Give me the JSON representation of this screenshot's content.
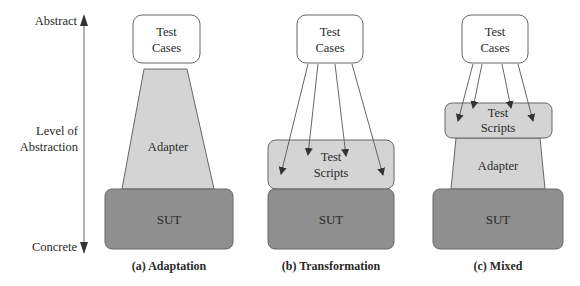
{
  "axis": {
    "top_label": "Abstract",
    "bottom_label": "Concrete",
    "middle_label_line1": "Level of",
    "middle_label_line2": "Abstraction"
  },
  "colors": {
    "test_cases_fill": "#ffffff",
    "adapter_fill": "#d4d4d4",
    "test_scripts_fill": "#d4d4d4",
    "sut_fill": "#8f8f8f",
    "stroke": "#555555",
    "text": "#2a2a2a"
  },
  "panels": [
    {
      "caption": "(a) Adaptation",
      "test_cases_line1": "Test",
      "test_cases_line2": "Cases",
      "adapter": "Adapter",
      "sut": "SUT"
    },
    {
      "caption": "(b) Transformation",
      "test_cases_line1": "Test",
      "test_cases_line2": "Cases",
      "test_scripts_line1": "Test",
      "test_scripts_line2": "Scripts",
      "sut": "SUT"
    },
    {
      "caption": "(c) Mixed",
      "test_cases_line1": "Test",
      "test_cases_line2": "Cases",
      "test_scripts_line1": "Test",
      "test_scripts_line2": "Scripts",
      "adapter": "Adapter",
      "sut": "SUT"
    }
  ]
}
